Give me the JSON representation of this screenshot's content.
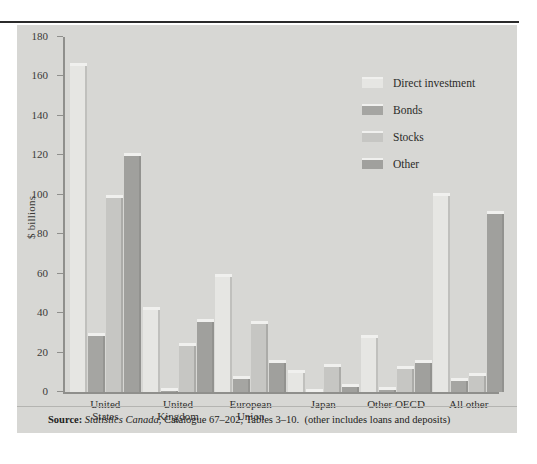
{
  "chart_data": {
    "type": "bar",
    "title": "",
    "xlabel": "",
    "ylabel": "$ billions",
    "ylim": [
      0,
      180
    ],
    "yticks": [
      0,
      20,
      40,
      60,
      80,
      100,
      120,
      140,
      160,
      180
    ],
    "ytick_labels": [
      "0",
      "20",
      "40",
      "60",
      "80",
      "100",
      "120",
      "140",
      "160",
      "180"
    ],
    "grid": false,
    "legend_position": "top-right",
    "categories": [
      "United States",
      "United Kingdom",
      "European Union",
      "Japan",
      "Other OECD",
      "All other"
    ],
    "category_lines": [
      [
        "United",
        "States"
      ],
      [
        "United",
        "Kingdom"
      ],
      [
        "European",
        "Union"
      ],
      [
        "Japan",
        ""
      ],
      [
        "Other OECD",
        ""
      ],
      [
        "All other",
        ""
      ]
    ],
    "series": [
      {
        "name": "Direct investment",
        "color": "#e6e6e3",
        "values": [
          167,
          43,
          60,
          11,
          29,
          101
        ]
      },
      {
        "name": "Bonds",
        "color": "#a5a5a2",
        "values": [
          30,
          2,
          8,
          1.5,
          2.5,
          7
        ]
      },
      {
        "name": "Stocks",
        "color": "#c6c6c3",
        "values": [
          100,
          25,
          36,
          14,
          13,
          9.5
        ]
      },
      {
        "name": "Other",
        "color": "#a0a09d",
        "values": [
          121,
          37,
          16,
          4,
          16,
          92
        ]
      }
    ]
  },
  "source": {
    "label": "Source:",
    "publication": "Statistics Canada",
    "rest": ", Catalogue 67–202, Tables 3–10.",
    "note": "(other includes loans and deposits)"
  },
  "colors": {
    "panel_background": "#d7d7d4",
    "axis": "#8f8f8c",
    "text": "#2b2b29",
    "top_rule": "#2b2b2b"
  }
}
